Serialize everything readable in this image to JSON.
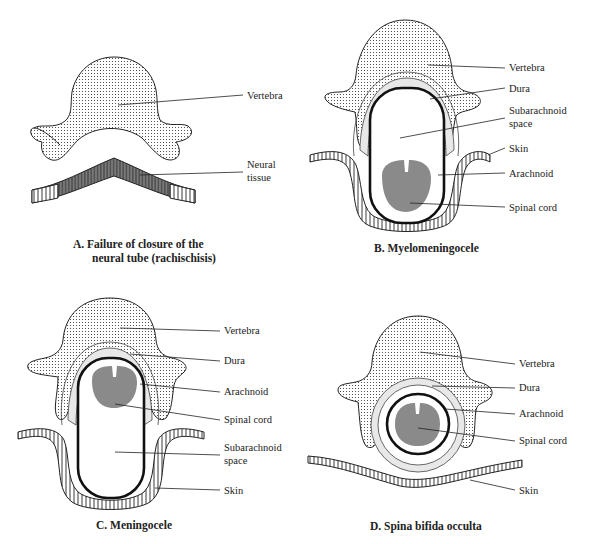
{
  "panels": {
    "A": {
      "caption_line1": "A.  Failure of closure of the",
      "caption_line2": "neural tube (rachischisis)",
      "labels": {
        "vertebra": "Vertebra",
        "neural_tissue_1": "Neural",
        "neural_tissue_2": "tissue"
      }
    },
    "B": {
      "caption": "B.  Myelomeningocele",
      "labels": {
        "vertebra": "Vertebra",
        "dura": "Dura",
        "subarachnoid_1": "Subarachnoid",
        "subarachnoid_2": "space",
        "skin": "Skin",
        "arachnoid": "Arachnoid",
        "spinal_cord": "Spinal cord"
      }
    },
    "C": {
      "caption": "C.  Meningocele",
      "labels": {
        "vertebra": "Vertebra",
        "dura": "Dura",
        "arachnoid": "Arachnoid",
        "spinal_cord": "Spinal cord",
        "subarachnoid_1": "Subarachnoid",
        "subarachnoid_2": "space",
        "skin": "Skin"
      }
    },
    "D": {
      "caption": "D.  Spina bifida occulta",
      "labels": {
        "vertebra": "Vertebra",
        "dura": "Dura",
        "arachnoid": "Arachnoid",
        "spinal_cord": "Spinal cord",
        "skin": "Skin"
      }
    }
  },
  "colors": {
    "background": "#ffffff",
    "ink": "#222222",
    "spinal_cord": "#8a8a8a",
    "dura": "#e8e8e8",
    "neural_tissue": "#7a7a7a"
  }
}
